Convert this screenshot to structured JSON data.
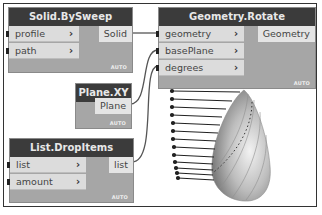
{
  "nodes": {
    "solid_bysweep": {
      "title": "Solid.BySweep",
      "inputs": [
        "profile",
        "path"
      ],
      "output": "Solid",
      "mode": "AUTO"
    },
    "geometry_rotate": {
      "title": "Geometry.Rotate",
      "inputs": [
        "geometry",
        "basePlane",
        "degrees"
      ],
      "output": "Geometry",
      "mode": "AUTO"
    },
    "plane_xy": {
      "title": "Plane.XY",
      "output": "Plane",
      "mode": "AUTO"
    },
    "list_dropitems": {
      "title": "List.DropItems",
      "inputs": [
        "list",
        "amount"
      ],
      "output": "list",
      "mode": "AUTO"
    }
  },
  "icons": {
    "port_arrow": "›"
  },
  "colors": {
    "node_header": "#3b3b3b",
    "node_body": "#a6a6a6",
    "port_bg": "#dcdcdc",
    "wire": "#555555"
  }
}
